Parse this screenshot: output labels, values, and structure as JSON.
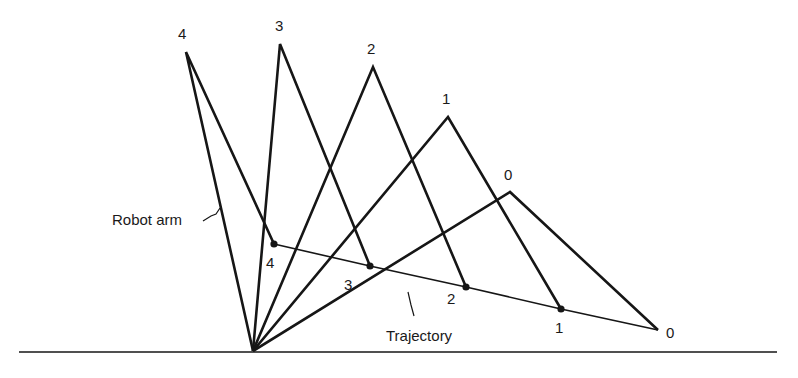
{
  "diagram": {
    "base": {
      "x": 253,
      "y": 351
    },
    "ground": {
      "x1": 19,
      "x2": 777,
      "y": 352
    },
    "arms": [
      {
        "id": "0",
        "elbow": {
          "x": 510,
          "y": 192
        },
        "end": {
          "x": 658,
          "y": 330
        },
        "elbow_label": "0",
        "end_label": "0",
        "elbow_label_pos": {
          "x": 504,
          "y": 180
        },
        "end_label_pos": {
          "x": 666,
          "y": 338
        }
      },
      {
        "id": "1",
        "elbow": {
          "x": 448,
          "y": 117
        },
        "end": {
          "x": 561,
          "y": 309
        },
        "elbow_label": "1",
        "end_label": "1",
        "elbow_label_pos": {
          "x": 442,
          "y": 104
        },
        "end_label_pos": {
          "x": 555,
          "y": 333
        }
      },
      {
        "id": "2",
        "elbow": {
          "x": 373,
          "y": 67
        },
        "end": {
          "x": 466,
          "y": 287
        },
        "elbow_label": "2",
        "end_label": "2",
        "elbow_label_pos": {
          "x": 367,
          "y": 54
        },
        "end_label_pos": {
          "x": 447,
          "y": 304
        }
      },
      {
        "id": "3",
        "elbow": {
          "x": 280,
          "y": 44
        },
        "end": {
          "x": 370,
          "y": 266
        },
        "elbow_label": "3",
        "end_label": "3",
        "elbow_label_pos": {
          "x": 275,
          "y": 31
        },
        "end_label_pos": {
          "x": 344,
          "y": 290
        }
      },
      {
        "id": "4",
        "elbow": {
          "x": 186,
          "y": 52
        },
        "end": {
          "x": 274,
          "y": 244
        },
        "elbow_label": "4",
        "end_label": "4",
        "elbow_label_pos": {
          "x": 178,
          "y": 39
        },
        "end_label_pos": {
          "x": 266,
          "y": 268
        }
      }
    ],
    "trajectory_points": [
      {
        "x": 274,
        "y": 244
      },
      {
        "x": 370,
        "y": 266
      },
      {
        "x": 466,
        "y": 287
      },
      {
        "x": 561,
        "y": 309
      },
      {
        "x": 658,
        "y": 330
      }
    ],
    "annotations": {
      "robot_arm": {
        "text": "Robot arm",
        "x": 112,
        "y": 225
      },
      "trajectory": {
        "text": "Trajectory",
        "x": 386,
        "y": 341
      }
    },
    "colors": {
      "ink": "#161616",
      "background": "#ffffff"
    }
  }
}
